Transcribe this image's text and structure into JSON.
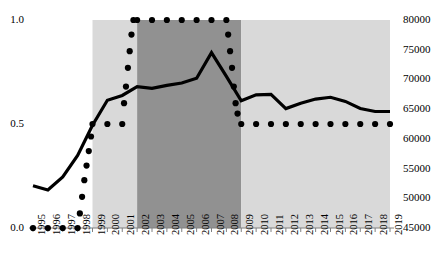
{
  "chart_data": {
    "type": "line",
    "title": "",
    "subtitle": "",
    "xlabel": "",
    "ylabel": "",
    "grid": false,
    "legend": "none",
    "categories": [
      1995,
      1996,
      1997,
      1998,
      1999,
      2000,
      2001,
      2002,
      2003,
      2004,
      2005,
      2006,
      2007,
      2008,
      2009,
      2010,
      2011,
      2012,
      2013,
      2014,
      2015,
      2016,
      2017,
      2018,
      2019
    ],
    "xtick_labels": [
      "1995",
      "1996",
      "1997",
      "1998",
      "1999",
      "2000",
      "2001",
      "2002",
      "2003",
      "2004",
      "2005",
      "2006",
      "2007",
      "2008",
      "2009",
      "2010",
      "2011",
      "2012",
      "2013",
      "2014",
      "2015",
      "2016",
      "2017",
      "2018",
      "2019"
    ],
    "axes": {
      "left": {
        "label": "",
        "ylim": [
          0.0,
          1.0
        ],
        "ticks": [
          0.0,
          0.5,
          1.0
        ],
        "tick_labels": [
          "0.0",
          "0.5",
          "1.0"
        ]
      },
      "right": {
        "label": "",
        "ylim": [
          45000,
          80000
        ],
        "ticks": [
          45000,
          50000,
          55000,
          60000,
          65000,
          70000,
          75000,
          80000
        ],
        "tick_labels": [
          "45000",
          "50000",
          "55000",
          "60000",
          "65000",
          "70000",
          "75000",
          "80000"
        ]
      }
    },
    "series": [
      {
        "name": "solid-line-series",
        "axis": "right",
        "style": "solid-line",
        "color": "#000000",
        "linewidth": 3.2,
        "x": [
          1995,
          1996,
          1997,
          1998,
          1999,
          2000,
          2001,
          2002,
          2003,
          2004,
          2005,
          2006,
          2007,
          2008,
          2009,
          2010,
          2011,
          2012,
          2013,
          2014,
          2015,
          2016,
          2017,
          2018,
          2019
        ],
        "values": [
          52100,
          51400,
          53600,
          57200,
          62300,
          66500,
          67300,
          68800,
          68500,
          69000,
          69400,
          70200,
          74500,
          70500,
          66400,
          67400,
          67500,
          65100,
          66000,
          66700,
          67000,
          66300,
          65100,
          64600,
          64600
        ]
      },
      {
        "name": "dotted-series",
        "axis": "left",
        "style": "dotted-markers",
        "color": "#000000",
        "marker_size": 5,
        "x": [
          1995,
          1996,
          1997,
          1998,
          1998.15,
          1998.3,
          1998.45,
          1998.6,
          1998.75,
          1998.9,
          1999,
          2000,
          2001,
          2001.12,
          2001.25,
          2001.38,
          2001.5,
          2001.62,
          2001.75,
          2002,
          2003,
          2004,
          2005,
          2006,
          2007,
          2008,
          2008.12,
          2008.25,
          2008.38,
          2008.5,
          2008.62,
          2008.75,
          2009,
          2010,
          2011,
          2012,
          2013,
          2014,
          2015,
          2016,
          2017,
          2018,
          2019
        ],
        "values": [
          0.0,
          0.0,
          0.0,
          0.0,
          0.07,
          0.15,
          0.23,
          0.3,
          0.37,
          0.44,
          0.5,
          0.5,
          0.5,
          0.6,
          0.68,
          0.77,
          0.85,
          0.93,
          1.0,
          1.0,
          1.0,
          1.0,
          1.0,
          1.0,
          1.0,
          1.0,
          0.93,
          0.85,
          0.77,
          0.68,
          0.6,
          0.55,
          0.5,
          0.5,
          0.5,
          0.5,
          0.5,
          0.5,
          0.5,
          0.5,
          0.5,
          0.5,
          0.5
        ]
      }
    ],
    "shaded_bands": [
      {
        "name": "light-band-early",
        "from": 1999,
        "to": 2002,
        "color": "#d9d9d9"
      },
      {
        "name": "dark-band",
        "from": 2002,
        "to": 2009,
        "color": "#919191"
      },
      {
        "name": "light-band-late",
        "from": 2009,
        "to": 2019,
        "color": "#d9d9d9"
      }
    ]
  }
}
